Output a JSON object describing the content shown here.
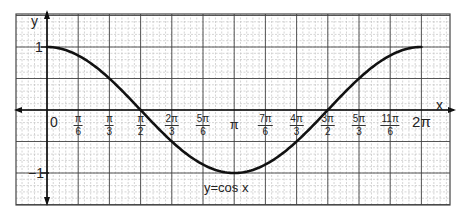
{
  "chart_data": {
    "type": "line",
    "title": "",
    "annotation": "y=cos x",
    "xlabel": "x",
    "ylabel": "y",
    "origin_label": "0",
    "x_ticks": [
      {
        "value": 0.5236,
        "num": "π",
        "den": "6"
      },
      {
        "value": 1.0472,
        "num": "π",
        "den": "3"
      },
      {
        "value": 1.5708,
        "num": "π",
        "den": "2"
      },
      {
        "value": 2.0944,
        "num": "2π",
        "den": "3"
      },
      {
        "value": 2.618,
        "num": "5π",
        "den": "6"
      },
      {
        "value": 3.1416,
        "label": "π"
      },
      {
        "value": 3.6652,
        "num": "7π",
        "den": "6"
      },
      {
        "value": 4.1888,
        "num": "4π",
        "den": "3"
      },
      {
        "value": 4.7124,
        "num": "3π",
        "den": "2"
      },
      {
        "value": 5.236,
        "num": "5π",
        "den": "3"
      },
      {
        "value": 5.7596,
        "num": "11π",
        "den": "6"
      },
      {
        "value": 6.2832,
        "label": "2π"
      }
    ],
    "y_ticks": [
      {
        "value": 1,
        "label": "1"
      },
      {
        "value": -1,
        "label": "−1"
      }
    ],
    "series": [
      {
        "name": "y=cos x",
        "x": [
          0,
          0.5236,
          1.0472,
          1.5708,
          2.0944,
          2.618,
          3.1416,
          3.6652,
          4.1888,
          4.7124,
          5.236,
          5.7596,
          6.2832
        ],
        "values": [
          1,
          0.866,
          0.5,
          0,
          -0.5,
          -0.866,
          -1,
          -0.866,
          -0.5,
          0,
          0.5,
          0.866,
          1
        ],
        "color": "#111111"
      }
    ],
    "xlim": [
      -0.6,
      6.9
    ],
    "ylim": [
      -1.5,
      1.6
    ],
    "grid": true,
    "legend": "none"
  },
  "colors": {
    "grid_minor": "#b8b8b8",
    "grid_major": "#444444",
    "axis": "#111111",
    "curve": "#111111"
  }
}
